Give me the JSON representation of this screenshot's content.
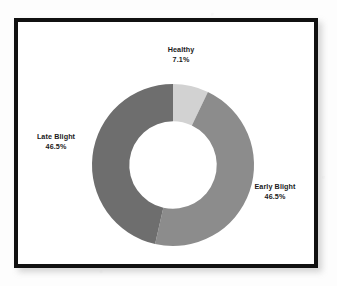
{
  "figure": {
    "background_color": "#ffffff",
    "frame_color": "#111111",
    "has_border": true
  },
  "chart_data": {
    "type": "pie",
    "variant": "donut",
    "title": "",
    "subtitle": "",
    "xlabel": "",
    "ylabel": "",
    "legend": "none",
    "labels_position": "outside",
    "start_angle_deg": 90,
    "direction": "clockwise",
    "hole_ratio": 0.54,
    "categories": [
      "Healthy",
      "Early Blight",
      "Late Blight"
    ],
    "values": [
      7.1,
      46.5,
      46.5
    ],
    "value_unit": "%",
    "colors": [
      "#d2d2d2",
      "#8c8c8c",
      "#6e6e6e"
    ],
    "slices": [
      {
        "name": "Healthy",
        "label": "Healthy",
        "percent_text": "7.1%",
        "value": 7.1,
        "color": "#d2d2d2",
        "angle_deg": 25.6
      },
      {
        "name": "Early Blight",
        "label": "Early Blight",
        "percent_text": "46.5%",
        "value": 46.5,
        "color": "#8c8c8c",
        "angle_deg": 167.4
      },
      {
        "name": "Late Blight",
        "label": "Late Blight",
        "percent_text": "46.5%",
        "value": 46.5,
        "color": "#6e6e6e",
        "angle_deg": 167.4
      }
    ]
  }
}
